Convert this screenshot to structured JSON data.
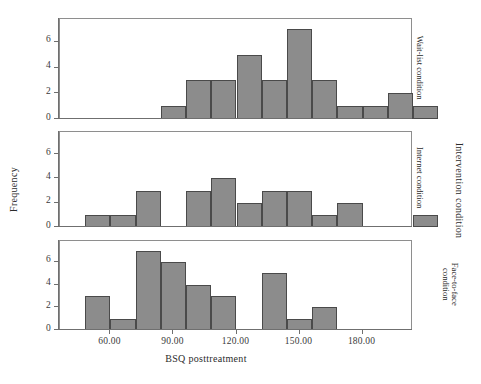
{
  "figure": {
    "xlabel": "BSQ posttreatment",
    "ylabel": "Frequency",
    "outer_right_label": "Intervention condition",
    "xticks": [
      "60.00",
      "90.00",
      "120.00",
      "150.00",
      "180.00"
    ],
    "yticks": [
      "0",
      "2",
      "4",
      "6"
    ],
    "bar_color": "#8c8c8c",
    "bar_edge_color": "#4a4a4a",
    "frame_color": "#8e8e8e"
  },
  "chart_data": {
    "type": "bar",
    "title": "",
    "xlabel": "BSQ posttreatment",
    "ylabel": "Frequency",
    "xlim": [
      36,
      204
    ],
    "ylim": [
      0,
      7.4
    ],
    "xtick_values": [
      60,
      90,
      120,
      150,
      180
    ],
    "ytick_values": [
      0,
      2,
      4,
      6
    ],
    "grid": false,
    "legend": "right strip labels",
    "bin_width": 12,
    "panels": [
      {
        "name": "wait-list",
        "strip_label": "Wait-list condition",
        "bins": [
          {
            "left": 84,
            "right": 96,
            "count": 1
          },
          {
            "left": 96,
            "right": 108,
            "count": 3
          },
          {
            "left": 108,
            "right": 120,
            "count": 3
          },
          {
            "left": 120,
            "right": 132,
            "count": 5
          },
          {
            "left": 132,
            "right": 144,
            "count": 3
          },
          {
            "left": 144,
            "right": 156,
            "count": 7
          },
          {
            "left": 156,
            "right": 168,
            "count": 3
          },
          {
            "left": 168,
            "right": 180,
            "count": 1
          },
          {
            "left": 180,
            "right": 192,
            "count": 1
          },
          {
            "left": 192,
            "right": 204,
            "count": 2
          },
          {
            "left": 204,
            "right": 216,
            "count": 1
          }
        ]
      },
      {
        "name": "internet",
        "strip_label": "Internet condition",
        "bins": [
          {
            "left": 48,
            "right": 60,
            "count": 1
          },
          {
            "left": 60,
            "right": 72,
            "count": 1
          },
          {
            "left": 72,
            "right": 84,
            "count": 3
          },
          {
            "left": 84,
            "right": 96,
            "count": 0
          },
          {
            "left": 96,
            "right": 108,
            "count": 3
          },
          {
            "left": 108,
            "right": 120,
            "count": 4
          },
          {
            "left": 120,
            "right": 132,
            "count": 2
          },
          {
            "left": 132,
            "right": 144,
            "count": 3
          },
          {
            "left": 144,
            "right": 156,
            "count": 3
          },
          {
            "left": 156,
            "right": 168,
            "count": 1
          },
          {
            "left": 168,
            "right": 180,
            "count": 2
          },
          {
            "left": 180,
            "right": 192,
            "count": 0
          },
          {
            "left": 192,
            "right": 204,
            "count": 0
          },
          {
            "left": 204,
            "right": 216,
            "count": 1
          }
        ]
      },
      {
        "name": "face-to-face",
        "strip_label": "Face-to-face condition",
        "bins": [
          {
            "left": 48,
            "right": 60,
            "count": 3
          },
          {
            "left": 60,
            "right": 72,
            "count": 1
          },
          {
            "left": 72,
            "right": 84,
            "count": 7
          },
          {
            "left": 84,
            "right": 96,
            "count": 6
          },
          {
            "left": 96,
            "right": 108,
            "count": 4
          },
          {
            "left": 108,
            "right": 120,
            "count": 3
          },
          {
            "left": 120,
            "right": 132,
            "count": 0
          },
          {
            "left": 132,
            "right": 144,
            "count": 5
          },
          {
            "left": 144,
            "right": 156,
            "count": 1
          },
          {
            "left": 156,
            "right": 168,
            "count": 2
          }
        ]
      }
    ]
  }
}
